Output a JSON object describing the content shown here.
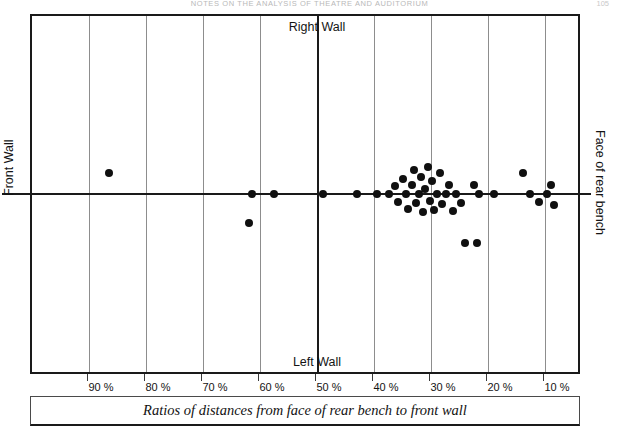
{
  "header": {
    "running_head": "NOTES ON THE ANALYSIS OF THEATRE AND AUDITORIUM",
    "page_number": "105"
  },
  "figure": {
    "caption": "Ratios of distances from face of rear bench to front wall",
    "labels": {
      "top_center": "Right Wall",
      "bottom_center": "Left Wall",
      "left_side": "Front  Wall",
      "right_side": "Face of rear bench"
    }
  },
  "chart_data": {
    "type": "scatter",
    "title": "",
    "subtitle": "",
    "xlabel": "Ratios of distances from face of rear bench to front wall",
    "ylabel": "",
    "xlim": [
      100,
      0
    ],
    "ylim": [
      -1,
      1
    ],
    "grid": true,
    "legend": null,
    "axis_note": "x axis runs right-to-left from 90% down to 10%; horizontal baseline at y=0; vertical reference line at 50%",
    "xticks": [
      90,
      80,
      70,
      60,
      50,
      40,
      30,
      20,
      10
    ],
    "xtick_labels": [
      "90 %",
      "80 %",
      "70 %",
      "60 %",
      "50 %",
      "40 %",
      "30 %",
      "20 %",
      "10 %"
    ],
    "annotations": [
      {
        "text": "Right Wall",
        "x": 50,
        "y": 0.95,
        "note": "top of 50% vertical line"
      },
      {
        "text": "Left Wall",
        "x": 50,
        "y": -0.95,
        "note": "bottom of 50% vertical line"
      },
      {
        "text": "Front  Wall",
        "position": "left-axis",
        "rotation": -90
      },
      {
        "text": "Face of rear bench",
        "position": "right-axis",
        "rotation": 90
      }
    ],
    "marker": {
      "shape": "circle",
      "color": "#101010",
      "size_px": 8
    },
    "points": [
      {
        "x": 86.5,
        "y": 0.22
      },
      {
        "x": 62.0,
        "y": -0.3
      },
      {
        "x": 61.5,
        "y": 0.0
      },
      {
        "x": 57.5,
        "y": 0.0
      },
      {
        "x": 49.0,
        "y": 0.0
      },
      {
        "x": 43.0,
        "y": 0.0
      },
      {
        "x": 39.5,
        "y": 0.0
      },
      {
        "x": 37.4,
        "y": 0.0
      },
      {
        "x": 36.4,
        "y": 0.08
      },
      {
        "x": 35.8,
        "y": -0.08
      },
      {
        "x": 35.0,
        "y": 0.16
      },
      {
        "x": 34.4,
        "y": 0.0
      },
      {
        "x": 34.0,
        "y": -0.16
      },
      {
        "x": 33.4,
        "y": 0.1
      },
      {
        "x": 33.0,
        "y": 0.25
      },
      {
        "x": 32.6,
        "y": -0.09
      },
      {
        "x": 32.2,
        "y": 0.0
      },
      {
        "x": 31.8,
        "y": 0.18
      },
      {
        "x": 31.4,
        "y": -0.19
      },
      {
        "x": 31.0,
        "y": 0.05
      },
      {
        "x": 30.6,
        "y": 0.28
      },
      {
        "x": 30.2,
        "y": -0.07
      },
      {
        "x": 29.8,
        "y": 0.14
      },
      {
        "x": 29.4,
        "y": -0.17
      },
      {
        "x": 29.0,
        "y": 0.0
      },
      {
        "x": 28.4,
        "y": 0.22
      },
      {
        "x": 28.0,
        "y": -0.1
      },
      {
        "x": 27.4,
        "y": 0.0
      },
      {
        "x": 26.8,
        "y": 0.1
      },
      {
        "x": 26.2,
        "y": -0.18
      },
      {
        "x": 25.6,
        "y": 0.0
      },
      {
        "x": 24.8,
        "y": -0.09
      },
      {
        "x": 24.0,
        "y": -0.52
      },
      {
        "x": 22.0,
        "y": -0.52
      },
      {
        "x": 22.4,
        "y": 0.09
      },
      {
        "x": 21.6,
        "y": 0.0
      },
      {
        "x": 19.0,
        "y": 0.0
      },
      {
        "x": 13.8,
        "y": 0.22
      },
      {
        "x": 12.6,
        "y": 0.0
      },
      {
        "x": 11.0,
        "y": -0.08
      },
      {
        "x": 9.6,
        "y": 0.0
      },
      {
        "x": 9.0,
        "y": 0.1
      },
      {
        "x": 8.4,
        "y": -0.12
      }
    ]
  }
}
